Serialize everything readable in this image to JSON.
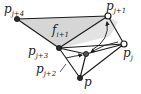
{
  "figure": {
    "colors": {
      "shade": "#d9d9d9",
      "edge": "#1a1a1a",
      "filled_vertex": "#2b2b2b",
      "hollow_vertex": "#ffffff"
    },
    "vertices": [
      {
        "id": "pj4",
        "label": "p",
        "sub": "j+4",
        "x": 17,
        "y": 19,
        "style": "filled"
      },
      {
        "id": "pj1",
        "label": "p",
        "sub": "j+1",
        "x": 108,
        "y": 16,
        "style": "hollow"
      },
      {
        "id": "pj",
        "label": "p",
        "sub": "j",
        "x": 124,
        "y": 44,
        "style": "hollow"
      },
      {
        "id": "pj3",
        "label": "p",
        "sub": "j+3",
        "x": 59,
        "y": 48,
        "style": "filled"
      },
      {
        "id": "pj2",
        "label": "p",
        "sub": "j+2",
        "x": 86,
        "y": 54,
        "style": "filled"
      },
      {
        "id": "p",
        "label": "p",
        "sub": "",
        "x": 80,
        "y": 78,
        "style": "filled"
      }
    ],
    "face_label": {
      "main": "f",
      "sub": "i+1"
    },
    "labels": {
      "pj4_main": "p",
      "pj4_sub": "j+4",
      "pj1_main": "p",
      "pj1_sub": "j+1",
      "pj_main": "p",
      "pj_sub": "j",
      "pj3_main": "p",
      "pj3_sub": "j+3",
      "pj2_main": "p",
      "pj2_sub": "j+2",
      "p_main": "p",
      "face_main": "f",
      "face_sub": "i+1"
    }
  }
}
